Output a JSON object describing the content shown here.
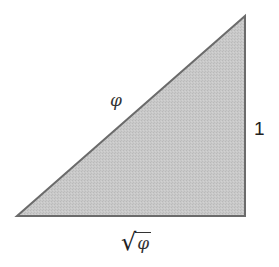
{
  "diagram": {
    "type": "right-triangle",
    "vertices": {
      "bottom_left": [
        17,
        216
      ],
      "bottom_right": [
        245,
        216
      ],
      "top_right": [
        245,
        16
      ]
    },
    "right_angle_at": "bottom_right",
    "fill_color": "#c6c6c6",
    "stroke_color": "#6b6b6b",
    "labels": {
      "hypotenuse": "φ",
      "vertical_side": "1",
      "horizontal_side_radical": "√",
      "horizontal_side_radicand": "φ"
    }
  }
}
